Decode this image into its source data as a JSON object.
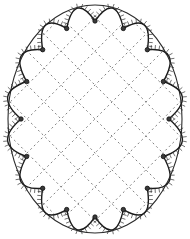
{
  "figure": {
    "type": "line-drawing",
    "background_color": "#ffffff",
    "ink_color": "#1a1a1a",
    "canvas": {
      "width": 190,
      "height": 239
    }
  },
  "outer_frame": {
    "name": "outer-ellipse",
    "shape": "ellipse",
    "center_x": 95,
    "center_y": 119,
    "radius_x": 87,
    "radius_y": 114,
    "stroke_color": "#2a2a2a",
    "stroke_width": 1.1,
    "fill": "none"
  },
  "scallop_border": {
    "name": "scalloped-inner-border",
    "lobe_count": 16,
    "cusp_count": 16,
    "center_x": 95,
    "center_y": 119,
    "radius_x": 74,
    "radius_y": 98,
    "lobe_bulge": 15,
    "stroke_color": "#1a1a1a",
    "stroke_width": 1.4,
    "fill": "none",
    "start_angle_deg": -90
  },
  "hatching": {
    "name": "scallop-hatching",
    "tick_count_per_lobe": 13,
    "tick_length": 4.5,
    "stroke_color": "#333333",
    "stroke_width": 0.7,
    "direction": "outward"
  },
  "cusp_nodes": {
    "name": "cusp-node",
    "count": 16,
    "radius": 2.2,
    "fill_color": "#3a3a3a",
    "stroke_color": "#111111",
    "stroke_width": 0.8
  },
  "lattice": {
    "name": "diagonal-dashed-lattice",
    "pattern": "diamond-grid",
    "angle_deg": 45,
    "spacing": 24,
    "stroke_color": "#555555",
    "stroke_width": 0.75,
    "dash_array": "2 3",
    "clip_shape": "scalloped-inner-border"
  },
  "chart_data": {
    "type": "scatter",
    "xlabel": "",
    "ylabel": "",
    "xlim": [
      0,
      190
    ],
    "ylim": [
      0,
      239
    ],
    "series": [
      {
        "name": "cusp-nodes",
        "x": [
          95,
          123,
          147,
          166,
          177,
          179,
          172,
          157,
          136,
          111,
          83,
          57,
          35,
          19,
          11,
          12
        ],
        "y": [
          21,
          26,
          40,
          61,
          88,
          119,
          150,
          177,
          198,
          213,
          218,
          213,
          198,
          177,
          150,
          119
        ]
      }
    ]
  }
}
